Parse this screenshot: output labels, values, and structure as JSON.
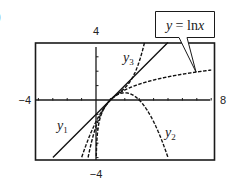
{
  "chart_data": {
    "type": "line",
    "title": "",
    "window": {
      "xmin": -4,
      "xmax": 8,
      "ymin": -4,
      "ymax": 4,
      "xscl": 1,
      "yscl": 1
    },
    "axis_labels": {
      "ymax": "4",
      "ymin": "−4",
      "xmin": "−4",
      "xmax": "8"
    },
    "grid": false,
    "series": [
      {
        "name": "y = ln x",
        "label": "y = ln x",
        "formula": "ln(x)",
        "style": "dashed",
        "callout": true
      },
      {
        "name": "y1",
        "label": "y",
        "sub": "1",
        "formula": "(x-1)",
        "style": "solid"
      },
      {
        "name": "y2",
        "label": "y",
        "sub": "2",
        "formula": "(x-1) - (x-1)^2/2",
        "style": "dashed"
      },
      {
        "name": "y3",
        "label": "y",
        "sub": "3",
        "formula": "(x-1) - (x-1)^2/2 + (x-1)^3/3",
        "style": "dashed"
      }
    ],
    "intersection_point": [
      1,
      0
    ]
  },
  "figure": {
    "corner_mark": ")"
  }
}
